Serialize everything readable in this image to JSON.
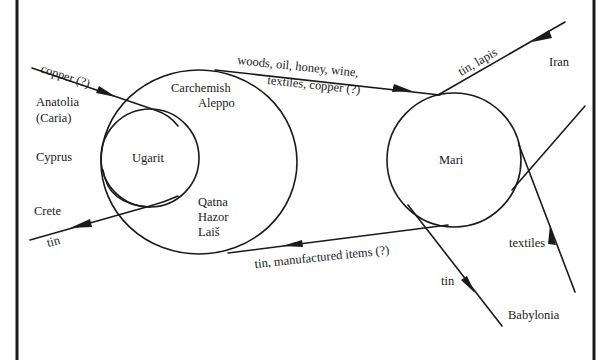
{
  "diagram": {
    "regions": {
      "anatolia": "Anatolia",
      "caria": "(Caria)",
      "cyprus": "Cyprus",
      "crete": "Crete",
      "ugarit": "Ugarit",
      "carchemish": "Carchemish",
      "aleppo": "Aleppo",
      "qatna": "Qatna",
      "hazor": "Hazor",
      "lais": "Laiš",
      "mari": "Mari",
      "iran": "Iran",
      "babylonia": "Babylonia"
    },
    "flows": {
      "copper_in": "copper (?)",
      "tin_out_crete": "tin",
      "westbound_goods_line1": "woods, oil, honey, wine,",
      "westbound_goods_line2": "textiles, copper (?)",
      "tin_lapis": "tin, lapis",
      "tin_manufactured": "tin, manufactured items (?)",
      "tin_babylonia": "tin",
      "textiles": "textiles"
    },
    "colors": {
      "ink": "#1a1a1a",
      "background": "#ffffff"
    }
  }
}
